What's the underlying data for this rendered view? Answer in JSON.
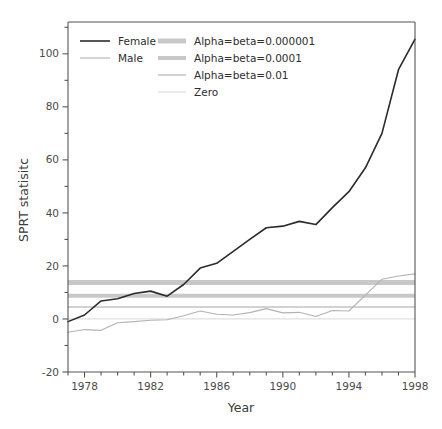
{
  "chart_data": {
    "type": "line",
    "title": "",
    "xlabel": "Year",
    "ylabel": "SPRT statisitc",
    "xlim": [
      1977,
      1998
    ],
    "ylim": [
      -20,
      112
    ],
    "grid": false,
    "legend_position": "top-left inside",
    "x_ticks_major": [
      1978,
      1982,
      1986,
      1990,
      1994,
      1998
    ],
    "x_ticks_minor_step": 1,
    "y_ticks_major": [
      -20,
      0,
      20,
      40,
      60,
      80,
      100
    ],
    "y_ticks_minor_step": 10,
    "x": [
      1977,
      1978,
      1979,
      1980,
      1981,
      1982,
      1983,
      1984,
      1985,
      1986,
      1987,
      1988,
      1989,
      1990,
      1991,
      1992,
      1993,
      1994,
      1995,
      1996,
      1997,
      1998
    ],
    "series": [
      {
        "name": "Female",
        "color": "#2b2b2b",
        "width": 1.6,
        "values": [
          -1.0,
          1.5,
          6.8,
          7.6,
          9.6,
          10.5,
          8.6,
          13.0,
          19.2,
          21.0,
          25.5,
          30.0,
          34.4,
          35.0,
          36.8,
          35.6,
          42.0,
          48.0,
          57.0,
          70.0,
          94.0,
          105.5
        ]
      },
      {
        "name": "Male",
        "color": "#b3b3b3",
        "width": 1.1,
        "values": [
          -5.0,
          -4.0,
          -4.3,
          -1.4,
          -1.0,
          -0.5,
          -0.3,
          1.2,
          3.0,
          1.8,
          1.5,
          2.4,
          3.9,
          2.3,
          2.5,
          0.9,
          3.2,
          3.0,
          9.0,
          15.0,
          16.2,
          17.0
        ]
      }
    ],
    "threshold_lines": [
      {
        "name": "Alpha=beta=0.000001",
        "value": 13.8,
        "color": "#c8c8c8",
        "width": 5.0
      },
      {
        "name": "Alpha=beta=0.0001",
        "value": 8.8,
        "color": "#c8c8c8",
        "width": 4.0
      },
      {
        "name": "Alpha=beta=0.01",
        "value": 4.5,
        "color": "#d2d2d2",
        "width": 2.0
      },
      {
        "name": "Zero",
        "value": 0.0,
        "color": "#e0e0e0",
        "width": 1.3
      }
    ]
  },
  "legend": {
    "entries": [
      {
        "label": "Female"
      },
      {
        "label": "Male"
      },
      {
        "label": "Alpha=beta=0.000001"
      },
      {
        "label": "Alpha=beta=0.0001"
      },
      {
        "label": "Alpha=beta=0.01"
      },
      {
        "label": "Zero"
      }
    ]
  },
  "axes": {
    "x_tick_labels": [
      "1978",
      "1982",
      "1986",
      "1990",
      "1994",
      "1998"
    ],
    "y_tick_labels": [
      "-20",
      "0",
      "20",
      "40",
      "60",
      "80",
      "100"
    ],
    "x_axis_title": "Year",
    "y_axis_title": "SPRT statisitc"
  },
  "colors": {
    "axis": "#555555",
    "female": "#2b2b2b",
    "male": "#b3b3b3",
    "threshold": "#c8c8c8",
    "background": "#ffffff"
  }
}
